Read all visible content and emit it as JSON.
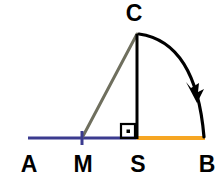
{
  "figure": {
    "width": 223,
    "height": 179,
    "background": "#ffffff"
  },
  "colors": {
    "baseline_blue": "#3b3b8f",
    "segment_orange": "#f6a623",
    "hypotenuse_gray": "#6f6f5e",
    "altitude_black": "#000000",
    "arc_black": "#000000",
    "label_black": "#000000",
    "tick_blue": "#3b3b8f"
  },
  "labels": {
    "A": "A",
    "M": "M",
    "S": "S",
    "B": "B",
    "C": "C"
  },
  "points": {
    "A": {
      "x": 28,
      "y": 138
    },
    "M": {
      "x": 82,
      "y": 138
    },
    "S": {
      "x": 137,
      "y": 138
    },
    "B": {
      "x": 205,
      "y": 138
    },
    "C": {
      "x": 137,
      "y": 33
    }
  },
  "label_positions": {
    "A": {
      "x": 29,
      "y": 172
    },
    "M": {
      "x": 83,
      "y": 172
    },
    "S": {
      "x": 138,
      "y": 172
    },
    "B": {
      "x": 207,
      "y": 172
    },
    "C": {
      "x": 134,
      "y": 21
    }
  },
  "segments": [
    {
      "name": "segment-A-S-blue",
      "from": "A",
      "to": "S",
      "color": "#3b3b8f",
      "width": 3,
      "path": "M 28 138 L 137 138"
    },
    {
      "name": "segment-S-B-orange",
      "from": "S",
      "to": "B",
      "color": "#f6a623",
      "width": 4,
      "path": "M 137 138 L 205 138"
    },
    {
      "name": "segment-M-C-hypotenuse",
      "from": "M",
      "to": "C",
      "color": "#6f6f5e",
      "width": 3,
      "path": "M 82 138 L 137 34"
    },
    {
      "name": "segment-C-S-altitude",
      "from": "C",
      "to": "S",
      "color": "#000000",
      "width": 3,
      "path": "M 137 34 L 137 139"
    }
  ],
  "arc": {
    "name": "arc-C-to-B",
    "from": "C",
    "to": "B",
    "center": "S",
    "radius": 105,
    "sweep_degrees": 90,
    "color": "#000000",
    "width": 3.2,
    "path": "M 139 34 Q 196 42 204 137",
    "arrowhead": {
      "tip_x": 197,
      "tip_y": 101,
      "direction": "clockwise-down-right"
    }
  },
  "markers": {
    "right_angle": {
      "name": "right-angle-marker-at-S",
      "vertex": "S",
      "x": 121,
      "y": 124,
      "size": 14,
      "color": "#000000",
      "has_center_dot": true
    },
    "midpoint_tick": {
      "name": "tick-mark-at-M",
      "at": "M",
      "x": 82,
      "y": 138,
      "half_height": 7,
      "color": "#3b3b8f",
      "width": 3
    }
  }
}
